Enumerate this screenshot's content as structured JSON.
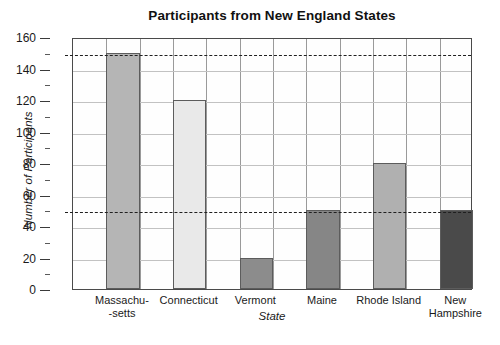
{
  "chart_data": {
    "type": "bar",
    "title": "Participants from New England States",
    "xlabel": "State",
    "ylabel": "Number of Participants",
    "categories": [
      "Massachu--setts",
      "Connecticut",
      "Vermont",
      "Maine",
      "Rhode Island",
      "New Hampshire"
    ],
    "category_lines": [
      [
        "Massachu-",
        "-setts"
      ],
      [
        "Connecticut",
        ""
      ],
      [
        "Vermont",
        ""
      ],
      [
        "Maine",
        ""
      ],
      [
        "Rhode Island",
        ""
      ],
      [
        "New",
        "Hampshire"
      ]
    ],
    "values": [
      150,
      120,
      20,
      50,
      80,
      50
    ],
    "bar_colors": [
      "#b5b5b5",
      "#e9e9e9",
      "#8c8c8c",
      "#868686",
      "#b0b0b0",
      "#4a4a4a"
    ],
    "ylim": [
      0,
      160
    ],
    "ytick_labels": [
      "0",
      "20",
      "40",
      "60",
      "80",
      "100",
      "120",
      "140",
      "160"
    ],
    "ytick_values": [
      0,
      20,
      40,
      60,
      80,
      100,
      120,
      140,
      160
    ],
    "yminor_values": [
      10,
      30,
      50,
      70,
      90,
      110,
      130,
      150
    ],
    "reference_lines": [
      150,
      50
    ],
    "grid": true,
    "grid_columns": 12,
    "legend": "none"
  }
}
